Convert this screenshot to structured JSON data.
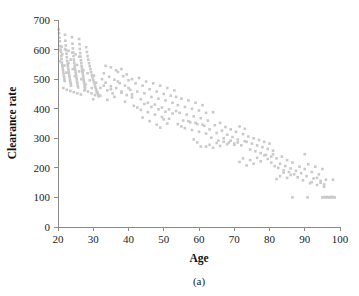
{
  "figure": {
    "caption": "(a)",
    "point_color": "#c9c9c9",
    "axis_color": "#8a8a8a",
    "text_color": "#1a1a1a"
  },
  "chart_data": {
    "type": "scatter",
    "title": "",
    "subtitle": "",
    "xlabel": "Age",
    "ylabel": "Clearance rate",
    "xlim": [
      20,
      100
    ],
    "ylim": [
      0,
      700
    ],
    "xticks": [
      20,
      30,
      40,
      50,
      60,
      70,
      80,
      90,
      100
    ],
    "yticks": [
      0,
      100,
      200,
      300,
      400,
      500,
      600,
      700
    ],
    "xtick_labels": [
      "20",
      "30",
      "40",
      "50",
      "60",
      "70",
      "80",
      "90",
      "100"
    ],
    "ytick_labels": [
      "0",
      "100",
      "200",
      "300",
      "400",
      "500",
      "600",
      "700"
    ],
    "grid": false,
    "legend": null,
    "annotations": [
      "(a)"
    ],
    "marker": {
      "shape": "square",
      "size": 2.6,
      "color": "#c9c9c9"
    },
    "points": [
      [
        20.2,
        668
      ],
      [
        20.3,
        655
      ],
      [
        20.4,
        640
      ],
      [
        20.5,
        628
      ],
      [
        20.6,
        612
      ],
      [
        20.7,
        600
      ],
      [
        20.8,
        592
      ],
      [
        20.9,
        578
      ],
      [
        21.0,
        568
      ],
      [
        21.1,
        556
      ],
      [
        21.2,
        548
      ],
      [
        21.3,
        540
      ],
      [
        21.4,
        532
      ],
      [
        21.5,
        524
      ],
      [
        21.6,
        516
      ],
      [
        21.7,
        508
      ],
      [
        21.8,
        500
      ],
      [
        21.9,
        494
      ],
      [
        22.0,
        650
      ],
      [
        22.1,
        630
      ],
      [
        22.2,
        614
      ],
      [
        22.3,
        598
      ],
      [
        22.4,
        586
      ],
      [
        22.5,
        574
      ],
      [
        22.6,
        562
      ],
      [
        22.7,
        552
      ],
      [
        22.8,
        544
      ],
      [
        22.9,
        536
      ],
      [
        23.0,
        528
      ],
      [
        23.1,
        520
      ],
      [
        23.2,
        512
      ],
      [
        23.3,
        506
      ],
      [
        23.4,
        498
      ],
      [
        23.5,
        490
      ],
      [
        23.6,
        484
      ],
      [
        23.7,
        478
      ],
      [
        24.0,
        642
      ],
      [
        24.1,
        620
      ],
      [
        24.2,
        604
      ],
      [
        24.3,
        590
      ],
      [
        24.4,
        578
      ],
      [
        24.5,
        566
      ],
      [
        24.6,
        556
      ],
      [
        24.7,
        546
      ],
      [
        24.8,
        538
      ],
      [
        24.9,
        530
      ],
      [
        25.0,
        522
      ],
      [
        25.1,
        514
      ],
      [
        25.2,
        508
      ],
      [
        25.3,
        500
      ],
      [
        25.4,
        492
      ],
      [
        25.5,
        486
      ],
      [
        25.6,
        478
      ],
      [
        25.7,
        472
      ],
      [
        26.0,
        636
      ],
      [
        26.1,
        618
      ],
      [
        26.2,
        602
      ],
      [
        26.3,
        588
      ],
      [
        26.4,
        576
      ],
      [
        26.5,
        564
      ],
      [
        26.6,
        554
      ],
      [
        26.7,
        544
      ],
      [
        26.8,
        536
      ],
      [
        26.9,
        528
      ],
      [
        27.0,
        520
      ],
      [
        27.1,
        512
      ],
      [
        27.2,
        504
      ],
      [
        27.3,
        496
      ],
      [
        27.4,
        490
      ],
      [
        27.5,
        482
      ],
      [
        27.6,
        474
      ],
      [
        27.7,
        468
      ],
      [
        28.0,
        608
      ],
      [
        28.2,
        592
      ],
      [
        28.4,
        578
      ],
      [
        28.6,
        566
      ],
      [
        28.8,
        554
      ],
      [
        29.0,
        544
      ],
      [
        29.2,
        534
      ],
      [
        29.4,
        524
      ],
      [
        29.6,
        514
      ],
      [
        29.8,
        506
      ],
      [
        30.0,
        498
      ],
      [
        30.2,
        490
      ],
      [
        30.4,
        482
      ],
      [
        30.6,
        474
      ],
      [
        30.8,
        466
      ],
      [
        31.0,
        460
      ],
      [
        31.2,
        454
      ],
      [
        31.4,
        448
      ],
      [
        20.5,
        560
      ],
      [
        21.2,
        584
      ],
      [
        21.8,
        546
      ],
      [
        22.4,
        522
      ],
      [
        23.0,
        554
      ],
      [
        23.6,
        566
      ],
      [
        24.2,
        534
      ],
      [
        24.8,
        510
      ],
      [
        25.4,
        548
      ],
      [
        26.0,
        526
      ],
      [
        26.6,
        500
      ],
      [
        27.2,
        530
      ],
      [
        27.8,
        482
      ],
      [
        28.4,
        520
      ],
      [
        29.0,
        496
      ],
      [
        29.6,
        470
      ],
      [
        30.2,
        512
      ],
      [
        30.8,
        488
      ],
      [
        21.0,
        610
      ],
      [
        22.0,
        602
      ],
      [
        23.0,
        596
      ],
      [
        24.0,
        590
      ],
      [
        25.0,
        584
      ],
      [
        26.0,
        576
      ],
      [
        21.5,
        470
      ],
      [
        22.5,
        464
      ],
      [
        23.5,
        460
      ],
      [
        24.5,
        456
      ],
      [
        25.5,
        452
      ],
      [
        26.5,
        448
      ],
      [
        27.5,
        462
      ],
      [
        28.5,
        458
      ],
      [
        29.5,
        452
      ],
      [
        30.5,
        446
      ],
      [
        31.5,
        442
      ],
      [
        32.0,
        470
      ],
      [
        32.5,
        500
      ],
      [
        33.0,
        520
      ],
      [
        33.5,
        488
      ],
      [
        34.0,
        462
      ],
      [
        34.5,
        508
      ],
      [
        35.0,
        476
      ],
      [
        35.5,
        452
      ],
      [
        36.0,
        498
      ],
      [
        36.5,
        470
      ],
      [
        37.0,
        524
      ],
      [
        37.5,
        486
      ],
      [
        38.0,
        458
      ],
      [
        38.5,
        510
      ],
      [
        39.0,
        478
      ],
      [
        39.5,
        446
      ],
      [
        40.0,
        496
      ],
      [
        40.5,
        464
      ],
      [
        41.0,
        438
      ],
      [
        30.0,
        432
      ],
      [
        31.0,
        456
      ],
      [
        32.0,
        444
      ],
      [
        33.0,
        478
      ],
      [
        34.0,
        430
      ],
      [
        35.0,
        466
      ],
      [
        36.0,
        440
      ],
      [
        37.0,
        492
      ],
      [
        38.0,
        454
      ],
      [
        39.0,
        424
      ],
      [
        40.0,
        470
      ],
      [
        41.0,
        448
      ],
      [
        33.5,
        545
      ],
      [
        35.0,
        540
      ],
      [
        36.5,
        530
      ],
      [
        38.0,
        534
      ],
      [
        39.5,
        516
      ],
      [
        41.0,
        500
      ],
      [
        42.0,
        486
      ],
      [
        42.5,
        458
      ],
      [
        43.0,
        504
      ],
      [
        43.5,
        432
      ],
      [
        44.0,
        478
      ],
      [
        44.5,
        452
      ],
      [
        45.0,
        492
      ],
      [
        45.5,
        420
      ],
      [
        46.0,
        466
      ],
      [
        46.5,
        440
      ],
      [
        47.0,
        486
      ],
      [
        47.5,
        414
      ],
      [
        48.0,
        458
      ],
      [
        48.5,
        434
      ],
      [
        49.0,
        478
      ],
      [
        49.5,
        404
      ],
      [
        50.0,
        450
      ],
      [
        50.5,
        428
      ],
      [
        51.0,
        470
      ],
      [
        51.5,
        398
      ],
      [
        52.0,
        444
      ],
      [
        52.5,
        420
      ],
      [
        53.0,
        462
      ],
      [
        53.5,
        392
      ],
      [
        41.5,
        410
      ],
      [
        42.5,
        404
      ],
      [
        43.5,
        396
      ],
      [
        44.5,
        416
      ],
      [
        45.5,
        388
      ],
      [
        46.5,
        406
      ],
      [
        47.5,
        380
      ],
      [
        48.5,
        398
      ],
      [
        49.5,
        372
      ],
      [
        50.5,
        390
      ],
      [
        51.5,
        366
      ],
      [
        52.5,
        384
      ],
      [
        44.0,
        370
      ],
      [
        46.0,
        358
      ],
      [
        48.0,
        346
      ],
      [
        49.0,
        336
      ],
      [
        50.0,
        364
      ],
      [
        51.0,
        350
      ],
      [
        53.5,
        440
      ],
      [
        54.0,
        412
      ],
      [
        54.5,
        386
      ],
      [
        55.0,
        434
      ],
      [
        55.5,
        360
      ],
      [
        56.0,
        406
      ],
      [
        56.5,
        380
      ],
      [
        57.0,
        428
      ],
      [
        57.5,
        354
      ],
      [
        58.0,
        400
      ],
      [
        58.5,
        374
      ],
      [
        59.0,
        420
      ],
      [
        59.5,
        348
      ],
      [
        60.0,
        394
      ],
      [
        60.5,
        368
      ],
      [
        61.0,
        412
      ],
      [
        61.5,
        342
      ],
      [
        62.0,
        386
      ],
      [
        54.0,
        348
      ],
      [
        55.0,
        340
      ],
      [
        56.0,
        334
      ],
      [
        57.0,
        358
      ],
      [
        58.0,
        328
      ],
      [
        59.0,
        352
      ],
      [
        60.0,
        322
      ],
      [
        61.0,
        346
      ],
      [
        62.0,
        316
      ],
      [
        58.5,
        296
      ],
      [
        59.5,
        286
      ],
      [
        60.5,
        272
      ],
      [
        62.5,
        360
      ],
      [
        63.0,
        330
      ],
      [
        63.5,
        302
      ],
      [
        64.0,
        388
      ],
      [
        64.5,
        344
      ],
      [
        65.0,
        318
      ],
      [
        65.5,
        292
      ],
      [
        66.0,
        352
      ],
      [
        66.5,
        326
      ],
      [
        67.0,
        300
      ],
      [
        67.5,
        338
      ],
      [
        68.0,
        312
      ],
      [
        68.5,
        286
      ],
      [
        69.0,
        330
      ],
      [
        69.5,
        304
      ],
      [
        70.0,
        278
      ],
      [
        70.5,
        322
      ],
      [
        71.0,
        296
      ],
      [
        62.0,
        272
      ],
      [
        63.0,
        278
      ],
      [
        64.0,
        268
      ],
      [
        65.0,
        284
      ],
      [
        66.0,
        274
      ],
      [
        67.0,
        288
      ],
      [
        68.0,
        280
      ],
      [
        69.0,
        292
      ],
      [
        70.0,
        282
      ],
      [
        71.0,
        286
      ],
      [
        72.0,
        276
      ],
      [
        73.0,
        290
      ],
      [
        71.5,
        340
      ],
      [
        72.5,
        314
      ],
      [
        73.0,
        332
      ],
      [
        73.5,
        288
      ],
      [
        74.0,
        306
      ],
      [
        74.5,
        262
      ],
      [
        75.0,
        282
      ],
      [
        75.5,
        300
      ],
      [
        76.0,
        256
      ],
      [
        76.5,
        276
      ],
      [
        77.0,
        294
      ],
      [
        77.5,
        250
      ],
      [
        78.0,
        270
      ],
      [
        78.5,
        288
      ],
      [
        79.0,
        244
      ],
      [
        79.5,
        264
      ],
      [
        80.0,
        282
      ],
      [
        80.5,
        238
      ],
      [
        71.5,
        220
      ],
      [
        72.5,
        232
      ],
      [
        73.5,
        208
      ],
      [
        74.5,
        226
      ],
      [
        75.5,
        214
      ],
      [
        76.5,
        234
      ],
      [
        77.5,
        222
      ],
      [
        78.5,
        242
      ],
      [
        79.5,
        230
      ],
      [
        80.5,
        218
      ],
      [
        81.0,
        246
      ],
      [
        81.5,
        206
      ],
      [
        81.0,
        258
      ],
      [
        82.0,
        232
      ],
      [
        82.5,
        200
      ],
      [
        83.0,
        214
      ],
      [
        83.5,
        238
      ],
      [
        84.0,
        192
      ],
      [
        84.5,
        206
      ],
      [
        85.0,
        226
      ],
      [
        85.5,
        186
      ],
      [
        86.0,
        198
      ],
      [
        86.5,
        218
      ],
      [
        87.0,
        178
      ],
      [
        82.0,
        162
      ],
      [
        83.0,
        172
      ],
      [
        84.0,
        184
      ],
      [
        85.0,
        166
      ],
      [
        86.0,
        176
      ],
      [
        86.5,
        100
      ],
      [
        87.5,
        190
      ],
      [
        88.0,
        168
      ],
      [
        88.5,
        204
      ],
      [
        89.0,
        182
      ],
      [
        89.5,
        158
      ],
      [
        90.0,
        196
      ],
      [
        90.5,
        172
      ],
      [
        90.8,
        100
      ],
      [
        91.0,
        212
      ],
      [
        91.5,
        148
      ],
      [
        92.0,
        186
      ],
      [
        92.5,
        164
      ],
      [
        93.0,
        204
      ],
      [
        93.5,
        142
      ],
      [
        94.0,
        178
      ],
      [
        94.5,
        156
      ],
      [
        95.0,
        196
      ],
      [
        95.5,
        136
      ],
      [
        90.0,
        246
      ],
      [
        92.0,
        152
      ],
      [
        93.5,
        166
      ],
      [
        94.5,
        150
      ],
      [
        95.5,
        144
      ],
      [
        96.0,
        160
      ],
      [
        95.0,
        100
      ],
      [
        95.5,
        101
      ],
      [
        96.0,
        100
      ],
      [
        96.3,
        102
      ],
      [
        96.7,
        100
      ],
      [
        97.0,
        101
      ],
      [
        97.3,
        100
      ],
      [
        97.6,
        102
      ],
      [
        97.9,
        100
      ],
      [
        98.0,
        160
      ],
      [
        98.2,
        101
      ],
      [
        98.5,
        100
      ]
    ]
  }
}
